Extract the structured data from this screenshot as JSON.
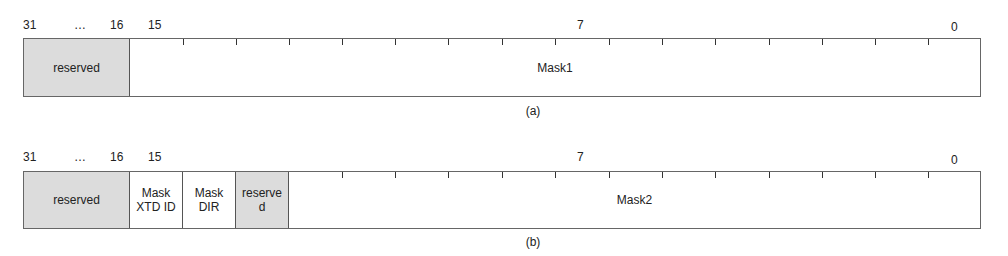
{
  "diagram_a": {
    "bit_labels": {
      "b31": "31",
      "ellipsis": "…",
      "b16": "16",
      "b15": "15",
      "b7": "7",
      "b0": "0"
    },
    "fields": [
      {
        "name": "reserved",
        "bits": "31-16",
        "shaded": true
      },
      {
        "name": "Mask1",
        "bits": "15-0",
        "shaded": false
      }
    ],
    "caption": "(a)"
  },
  "diagram_b": {
    "bit_labels": {
      "b31": "31",
      "ellipsis": "…",
      "b16": "16",
      "b15": "15",
      "b7": "7",
      "b0": "0"
    },
    "fields": [
      {
        "name": "reserved",
        "bits": "31-16",
        "shaded": true
      },
      {
        "name": "Mask XTD ID",
        "line1": "Mask",
        "line2": "XTD ID",
        "bits": "15",
        "shaded": false
      },
      {
        "name": "Mask DIR",
        "line1": "Mask",
        "line2": "DIR",
        "bits": "14",
        "shaded": false
      },
      {
        "name": "reserved",
        "line1": "reserve",
        "line2": "d",
        "bits": "13",
        "shaded": true
      },
      {
        "name": "Mask2",
        "bits": "12-0",
        "shaded": false
      }
    ],
    "caption": "(b)"
  },
  "colors": {
    "shaded": "#dcdcdc",
    "border": "#666666"
  }
}
